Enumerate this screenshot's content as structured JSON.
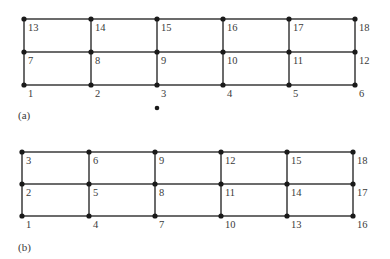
{
  "figure": {
    "panels": [
      {
        "id": "a",
        "caption": "(a)",
        "columns_x": [
          24,
          91,
          157,
          223,
          289,
          355
        ],
        "rows_y": [
          85,
          52,
          19
        ],
        "node_numbers": [
          [
            "1",
            "2",
            "3",
            "4",
            "5",
            "6"
          ],
          [
            "7",
            "8",
            "9",
            "10",
            "11",
            "12"
          ],
          [
            "13",
            "14",
            "15",
            "16",
            "17",
            "18"
          ]
        ],
        "numbering": "row-wise (along length)",
        "caption_pos": [
          18,
          119
        ]
      },
      {
        "id": "b",
        "caption": "(b)",
        "columns_x": [
          22,
          89,
          155,
          221,
          287,
          353
        ],
        "rows_y": [
          216,
          184,
          152
        ],
        "node_numbers": [
          [
            "1",
            "4",
            "7",
            "10",
            "13",
            "16"
          ],
          [
            "2",
            "5",
            "8",
            "11",
            "14",
            "17"
          ],
          [
            "3",
            "6",
            "9",
            "12",
            "15",
            "18"
          ]
        ],
        "numbering": "column-wise (along width)",
        "caption_pos": [
          18,
          251
        ]
      }
    ],
    "stray_dot": [
      157,
      108
    ],
    "colors": {
      "line": "#3a3a3a",
      "node": "#1a1a1a",
      "text": "#3a3a3a"
    }
  }
}
